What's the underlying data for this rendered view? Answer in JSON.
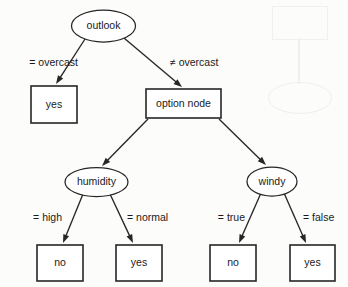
{
  "figure": {
    "type": "decision-tree-diagram",
    "background_color": "#fcfcfb",
    "ink_color": "#262626"
  },
  "nodes": [
    {
      "id": "outlook",
      "label": "outlook",
      "shape": "ellipse",
      "role": "attribute-node",
      "cx": 103.5,
      "cy": 26,
      "rx": 32,
      "ry": 16
    },
    {
      "id": "leaf-yes-1",
      "label": "yes",
      "shape": "rect",
      "role": "leaf-node",
      "x": 31,
      "y": 86,
      "w": 46,
      "h": 37
    },
    {
      "id": "option-node",
      "label": "option node",
      "shape": "rect",
      "role": "option-node",
      "x": 146,
      "y": 89,
      "w": 75,
      "h": 29
    },
    {
      "id": "humidity",
      "label": "humidity",
      "shape": "ellipse",
      "role": "attribute-node",
      "cx": 96.5,
      "cy": 182,
      "rx": 31.5,
      "ry": 14.5
    },
    {
      "id": "windy",
      "label": "windy",
      "shape": "ellipse",
      "role": "attribute-node",
      "cx": 272,
      "cy": 181.5,
      "rx": 25,
      "ry": 14.5
    },
    {
      "id": "leaf-no-2",
      "label": "no",
      "shape": "rect",
      "role": "leaf-node",
      "x": 37,
      "y": 245,
      "w": 46,
      "h": 36
    },
    {
      "id": "leaf-yes-2",
      "label": "yes",
      "shape": "rect",
      "role": "leaf-node",
      "x": 116,
      "y": 245,
      "w": 46,
      "h": 36
    },
    {
      "id": "leaf-no-3",
      "label": "no",
      "shape": "rect",
      "role": "leaf-node",
      "x": 210,
      "y": 245,
      "w": 46,
      "h": 36
    },
    {
      "id": "leaf-yes-3",
      "label": "yes",
      "shape": "rect",
      "role": "leaf-node",
      "x": 290,
      "y": 245,
      "w": 45,
      "h": 36
    }
  ],
  "edges": [
    {
      "id": "e1",
      "from": "outlook",
      "to": "leaf-yes-1",
      "label": "= overcast",
      "label_side": "left",
      "label_x": 78,
      "label_y": 63,
      "x1": 85,
      "y1": 39,
      "x2": 56,
      "y2": 84
    },
    {
      "id": "e2",
      "from": "outlook",
      "to": "option-node",
      "label": "≠ overcast",
      "label_side": "right",
      "label_x": 170,
      "label_y": 63,
      "x1": 124,
      "y1": 38,
      "x2": 182,
      "y2": 87
    },
    {
      "id": "e3",
      "from": "option-node",
      "to": "humidity",
      "label": "",
      "label_side": "",
      "label_x": 0,
      "label_y": 0,
      "x1": 148,
      "y1": 119,
      "x2": 102,
      "y2": 166
    },
    {
      "id": "e4",
      "from": "option-node",
      "to": "windy",
      "label": "",
      "label_side": "",
      "label_x": 0,
      "label_y": 0,
      "x1": 219,
      "y1": 119,
      "x2": 266,
      "y2": 165
    },
    {
      "id": "e5",
      "from": "humidity",
      "to": "leaf-no-2",
      "label": "= high",
      "label_side": "left",
      "label_x": 62,
      "label_y": 218,
      "x1": 83,
      "y1": 194,
      "x2": 63,
      "y2": 243
    },
    {
      "id": "e6",
      "from": "humidity",
      "to": "leaf-yes-2",
      "label": "= normal",
      "label_side": "right",
      "label_x": 127,
      "label_y": 218,
      "x1": 110,
      "y1": 194,
      "x2": 133,
      "y2": 243
    },
    {
      "id": "e7",
      "from": "windy",
      "to": "leaf-no-3",
      "label": "= true",
      "label_side": "left",
      "label_x": 245,
      "label_y": 218,
      "x1": 261,
      "y1": 193,
      "x2": 239,
      "y2": 243
    },
    {
      "id": "e8",
      "from": "windy",
      "to": "leaf-yes-3",
      "label": "= false",
      "label_side": "right",
      "label_x": 303,
      "label_y": 218,
      "x1": 284,
      "y1": 193,
      "x2": 306,
      "y2": 243
    }
  ]
}
